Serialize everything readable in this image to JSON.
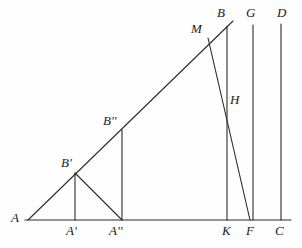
{
  "figure": {
    "type": "geometry-diagram",
    "background_color": "#fefefe",
    "stroke_color": "#2b2b2b",
    "label_color": "#1a1a1a",
    "stroke_width": 1,
    "width": 302,
    "height": 248
  },
  "labels": [
    {
      "id": "A",
      "text": "A",
      "x": 11,
      "y": 213
    },
    {
      "id": "Ap",
      "text": "A'",
      "x": 66,
      "y": 226
    },
    {
      "id": "App",
      "text": "A''",
      "x": 110,
      "y": 226
    },
    {
      "id": "K",
      "text": "K",
      "x": 222,
      "y": 226
    },
    {
      "id": "F",
      "text": "F",
      "x": 245,
      "y": 226
    },
    {
      "id": "C",
      "text": "C",
      "x": 275,
      "y": 226
    },
    {
      "id": "Bp",
      "text": "B'",
      "x": 62,
      "y": 158
    },
    {
      "id": "Bpp",
      "text": "B''",
      "x": 104,
      "y": 116
    },
    {
      "id": "M",
      "text": "M",
      "x": 192,
      "y": 24
    },
    {
      "id": "B",
      "text": "B",
      "x": 217,
      "y": 8
    },
    {
      "id": "G",
      "text": "G",
      "x": 247,
      "y": 8
    },
    {
      "id": "D",
      "text": "D",
      "x": 278,
      "y": 8
    },
    {
      "id": "H",
      "text": "H",
      "x": 230,
      "y": 95
    }
  ],
  "points": {
    "A": {
      "x": 28,
      "y": 220
    },
    "Ap": {
      "x": 75,
      "y": 220
    },
    "App": {
      "x": 122,
      "y": 220
    },
    "K": {
      "x": 227,
      "y": 220
    },
    "F": {
      "x": 250,
      "y": 220
    },
    "C": {
      "x": 281,
      "y": 220
    },
    "Bp": {
      "x": 75,
      "y": 173
    },
    "Bpp": {
      "x": 122,
      "y": 130
    },
    "M": {
      "x": 208,
      "y": 38
    },
    "B": {
      "x": 227,
      "y": 26
    },
    "G": {
      "x": 253,
      "y": 25
    },
    "D": {
      "x": 281,
      "y": 24
    },
    "H": {
      "x": 227,
      "y": 99
    },
    "hyp_end": {
      "x": 233,
      "y": 21
    },
    "base_start": {
      "x": 25,
      "y": 220
    },
    "base_end": {
      "x": 291,
      "y": 220
    }
  },
  "segments": [
    {
      "id": "base",
      "name": "baseline-A-to-C",
      "from": "base_start",
      "to": "base_end"
    },
    {
      "id": "hypotenuse",
      "name": "hypotenuse-A-to-B",
      "from": "A",
      "to": "hyp_end"
    },
    {
      "id": "Bp-Ap",
      "name": "vertical-Bprime-Aprime",
      "from": "Bp",
      "to": "Ap"
    },
    {
      "id": "Bp-App",
      "name": "diagonal-Bprime-Adoubleprime",
      "from": "Bp",
      "to": "App"
    },
    {
      "id": "Bpp-App",
      "name": "vertical-Bdoubleprime-Adoubleprime",
      "from": "Bpp",
      "to": "App"
    },
    {
      "id": "B-K",
      "name": "vertical-B-K",
      "from": "B",
      "to": "K"
    },
    {
      "id": "G-base",
      "name": "vertical-G",
      "from": "G",
      "to": "F"
    },
    {
      "id": "D-C",
      "name": "vertical-D-C",
      "from": "D",
      "to": "C"
    },
    {
      "id": "M-F",
      "name": "segment-M-through-H-to-F",
      "from": "M",
      "to": "F"
    }
  ]
}
